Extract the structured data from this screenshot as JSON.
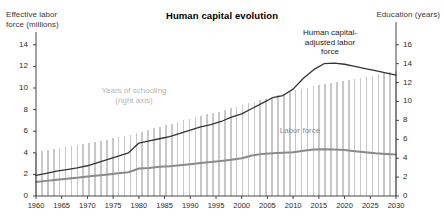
{
  "chart": {
    "title": "Human capital evolution",
    "left_axis_title": "Effective labor\nforce (millions)",
    "right_axis_title": "Education (years)",
    "annotations": {
      "schooling": "Years of schooling\n(right axis)",
      "human_capital": "Human capital-\nadjusted labor\nforce",
      "labor_force": "Labor force"
    }
  },
  "chart_data": {
    "type": "line",
    "title": "Human capital evolution",
    "xlabel": "",
    "ylabel": "Effective labor force (millions)",
    "y2label": "Education (years)",
    "ylim": [
      0,
      15
    ],
    "y2lim": [
      0,
      17.14
    ],
    "grid": false,
    "legend": "inline-annotations",
    "xlim": [
      1960,
      2030
    ],
    "yticks": [
      0,
      2,
      4,
      6,
      8,
      10,
      12,
      14
    ],
    "y2ticks": [
      0,
      2,
      4,
      6,
      8,
      10,
      12,
      14,
      16
    ],
    "xticks": [
      1960,
      1965,
      1970,
      1975,
      1980,
      1985,
      1990,
      1995,
      2000,
      2005,
      2010,
      2015,
      2020,
      2025,
      2030
    ],
    "x": [
      1960,
      1962,
      1964,
      1966,
      1968,
      1970,
      1972,
      1974,
      1976,
      1978,
      1980,
      1982,
      1984,
      1986,
      1988,
      1990,
      1992,
      1994,
      1996,
      1998,
      2000,
      2002,
      2004,
      2006,
      2008,
      2010,
      2012,
      2014,
      2016,
      2018,
      2020,
      2022,
      2024,
      2026,
      2028,
      2030
    ],
    "series": [
      {
        "name": "Years of schooling",
        "type": "bar",
        "axis": "right",
        "color": "#c8c8c8",
        "values": [
          4.6,
          4.8,
          5.0,
          5.2,
          5.4,
          5.6,
          5.8,
          6.0,
          6.2,
          6.4,
          6.7,
          7.0,
          7.3,
          7.6,
          7.9,
          8.2,
          8.5,
          8.7,
          9.0,
          9.3,
          9.6,
          9.9,
          10.2,
          10.5,
          10.8,
          11.1,
          11.4,
          11.6,
          11.8,
          12.0,
          12.2,
          12.4,
          12.6,
          12.8,
          13.0,
          13.2
        ]
      },
      {
        "name": "Human capital-adjusted labor force",
        "type": "line",
        "axis": "left",
        "color": "#333333",
        "values": [
          1.9,
          2.1,
          2.3,
          2.45,
          2.6,
          2.8,
          3.1,
          3.4,
          3.7,
          4.0,
          4.9,
          5.1,
          5.3,
          5.5,
          5.8,
          6.1,
          6.4,
          6.6,
          6.9,
          7.3,
          7.6,
          8.1,
          8.6,
          9.1,
          9.3,
          9.9,
          10.9,
          11.7,
          12.25,
          12.3,
          12.2,
          12.0,
          11.8,
          11.6,
          11.4,
          11.2
        ]
      },
      {
        "name": "Labor force",
        "type": "line",
        "axis": "left",
        "color": "#8a8a8a",
        "values": [
          1.3,
          1.4,
          1.5,
          1.6,
          1.7,
          1.8,
          1.9,
          2.0,
          2.1,
          2.2,
          2.55,
          2.6,
          2.7,
          2.75,
          2.85,
          2.95,
          3.05,
          3.15,
          3.25,
          3.35,
          3.5,
          3.75,
          3.9,
          3.95,
          4.0,
          4.05,
          4.2,
          4.3,
          4.33,
          4.3,
          4.25,
          4.15,
          4.05,
          3.95,
          3.9,
          3.85
        ]
      }
    ]
  }
}
